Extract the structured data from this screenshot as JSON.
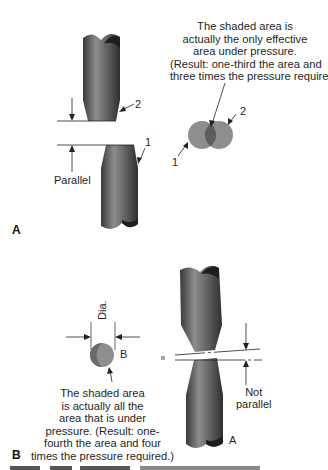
{
  "panels": {
    "a": {
      "letter": "A",
      "caption_lines": [
        "The shaded area is",
        "actually the only effective",
        "area under pressure.",
        "(Result: one-third the area and",
        "three times the pressure required.)"
      ],
      "label_parallel": "Parallel",
      "electrode_labels": [
        "1",
        "2"
      ],
      "circle_labels": [
        "1",
        "2"
      ]
    },
    "b": {
      "letter": "B",
      "caption_lines": [
        "The shaded area",
        "is actually all the",
        "area that is under",
        "pressure. (Result: one-",
        "fourth the area and four",
        "times the pressure required.)"
      ],
      "label_dia": "Dia.",
      "label_b": "B",
      "label_not_parallel": [
        "Not",
        "parallel"
      ],
      "label_a": "A"
    }
  },
  "colors": {
    "electrode": "#6e6e6e",
    "electrode_dark": "#2a2a2a",
    "shaded_circle": "#8a8a8a",
    "overlap": "#6a6a6a"
  }
}
